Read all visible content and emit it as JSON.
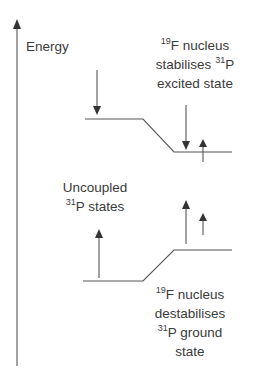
{
  "axis": {
    "label": "Energy"
  },
  "labels": {
    "top_right": {
      "line1_sup": "19",
      "line1": "F nucleus",
      "line2": "stabilises ",
      "line2_sup": "31",
      "line2_end": "P",
      "line3": "excited state"
    },
    "mid_left": {
      "line1": "Uncoupled",
      "line2_sup": "31",
      "line2": "P states"
    },
    "bottom_right": {
      "line1_sup": "19",
      "line1": "F nucleus",
      "line2": "destabilises",
      "line3_sup": "31",
      "line3": "P ground",
      "line4": "state"
    }
  },
  "colors": {
    "line": "#555555",
    "text": "#3a3a3a",
    "background": "#ffffff"
  }
}
